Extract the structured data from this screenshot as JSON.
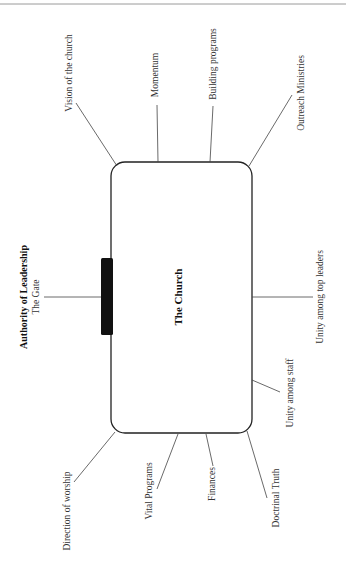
{
  "diagram": {
    "center": {
      "label": "The Church"
    },
    "gate": {
      "title": "Authority of Leadership",
      "subtitle": "The Gate"
    },
    "factors": {
      "top": [
        {
          "label": "Vision of the church"
        },
        {
          "label": "Momentum"
        },
        {
          "label": "Building programs"
        },
        {
          "label": "Outreach Ministries"
        }
      ],
      "right": [
        {
          "label": "Unity among top leaders"
        },
        {
          "label": "Unity among staff"
        }
      ],
      "bottom": [
        {
          "label": "Direction of worship"
        },
        {
          "label": "Vital Programs"
        },
        {
          "label": "Finances"
        },
        {
          "label": "Doctrinal Truth"
        }
      ]
    },
    "colors": {
      "box_stroke": "#222222",
      "gate_fill": "#111111",
      "rule": "#9a9a9a",
      "line": "#444444"
    }
  }
}
